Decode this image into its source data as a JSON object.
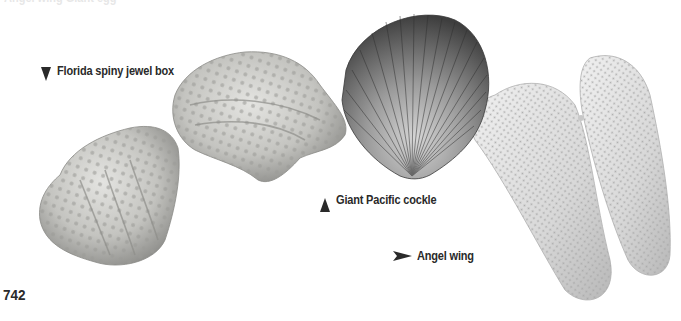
{
  "page": {
    "number": "742",
    "cutoff_top_text": "Angel wing Giant egg"
  },
  "labels": [
    {
      "id": "florida-spiny-jewel-box",
      "text": "Florida spiny jewel box",
      "pointer": "down"
    },
    {
      "id": "giant-pacific-cockle",
      "text": "Giant Pacific cockle",
      "pointer": "up"
    },
    {
      "id": "angel-wing",
      "text": "Angel wing",
      "pointer": "right"
    }
  ],
  "images": [
    {
      "id": "florida-spiny-jewel-box-shells",
      "subject": "Florida spiny jewel box",
      "count": 2
    },
    {
      "id": "giant-pacific-cockle-shell",
      "subject": "Giant Pacific cockle",
      "count": 1
    },
    {
      "id": "angel-wing-shells",
      "subject": "Angel wing",
      "count": 2
    }
  ],
  "colors": {
    "text": "#2a2a2a",
    "background": "#ffffff",
    "jewel_box": "#c9c9c6",
    "cockle_dark": "#4a4a4a",
    "cockle_light": "#bdbdbd",
    "angel_wing": "#dedede"
  }
}
